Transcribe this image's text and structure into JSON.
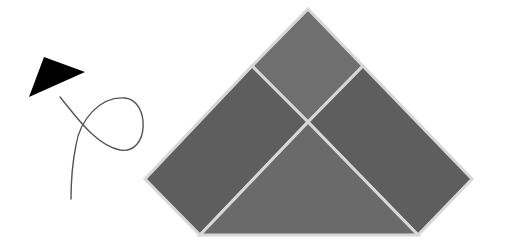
{
  "figure": {
    "width": 505,
    "height": 250,
    "background": "#ffffff",
    "arrowhead": {
      "points": "44,57 85,72 29,97",
      "fill": "#000000"
    },
    "curve": {
      "path": "M60,97 C75,115 95,145 120,150 C150,155 150,100 125,98 C100,96 80,120 76,145 C72,165 71,185 71,199",
      "stroke": "#555555",
      "width": 1.4
    },
    "tangram": {
      "gap_color": "#d8d8d8",
      "gap_width": 3,
      "pieces": [
        {
          "name": "top-square",
          "points": "308,9 363,66 308,122 252,66",
          "fill": "#6f6f6f"
        },
        {
          "name": "left-parallelogram",
          "points": "252,66 308,122 200,235 145,179",
          "fill": "#5e5e5e"
        },
        {
          "name": "right-parallelogram",
          "points": "363,66 472,179 418,235 308,122",
          "fill": "#5e5e5e"
        },
        {
          "name": "bottom-triangle",
          "points": "308,122 418,235 200,235",
          "fill": "#6a6a6a"
        }
      ]
    }
  }
}
